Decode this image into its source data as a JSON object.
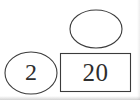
{
  "diagram": {
    "type": "shape-number-diagram",
    "background_color": "#ffffff",
    "stroke_color": "#3b3b3b",
    "text_color": "#2e2e2e",
    "canvas": {
      "width": 140,
      "height": 100
    },
    "shapes": [
      {
        "id": "top-ellipse",
        "kind": "ellipse",
        "label": "",
        "empty": true,
        "center_x": 96,
        "center_y": 29,
        "radius_x": 26,
        "radius_y": 19
      },
      {
        "id": "left-ellipse",
        "kind": "ellipse",
        "label": "2",
        "empty": false,
        "center_x": 31,
        "center_y": 73,
        "radius_x": 26,
        "radius_y": 21
      },
      {
        "id": "value-rectangle",
        "kind": "rectangle",
        "label": "20",
        "empty": false,
        "x": 60,
        "y": 53,
        "width": 71,
        "height": 39
      }
    ]
  }
}
